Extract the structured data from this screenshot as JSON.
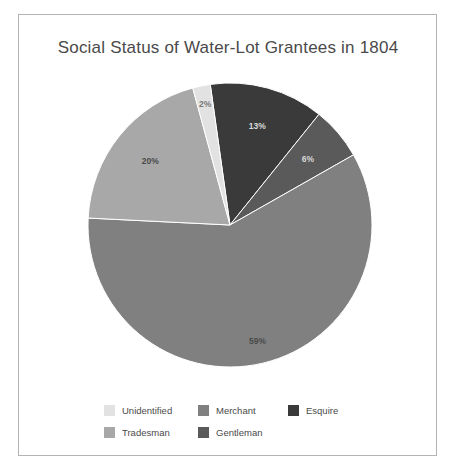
{
  "figure": {
    "title": "Social Status of Water-Lot Grantees in 1804",
    "background_color": "#ffffff",
    "frame_color": "#b4b4b4",
    "title_color": "#4a4a4a"
  },
  "chart_data": {
    "type": "pie",
    "title": "Social Status of Water-Lot Grantees in 1804",
    "xlabel": "",
    "ylabel": "",
    "categories": [
      "Esquire",
      "Gentleman",
      "Merchant",
      "Tradesman",
      "Unidentified"
    ],
    "values": [
      13,
      6,
      59,
      20,
      2
    ],
    "data_labels": [
      "13%",
      "6%",
      "59%",
      "20%",
      "2%"
    ],
    "units": "percent",
    "total": 100,
    "start_angle_deg": -8,
    "direction": "clockwise",
    "grid": false,
    "legend_position": "bottom",
    "colors": [
      "#3a3a3a",
      "#5a5a5a",
      "#808080",
      "#a8a8a8",
      "#e2e2e2"
    ],
    "slices": [
      {
        "label": "Esquire",
        "value": 13,
        "data_label": "13%",
        "color": "#3a3a3a",
        "label_color": "#d8d8d8"
      },
      {
        "label": "Gentleman",
        "value": 6,
        "data_label": "6%",
        "color": "#5a5a5a",
        "label_color": "#d8d8d8"
      },
      {
        "label": "Merchant",
        "value": 59,
        "data_label": "59%",
        "color": "#808080",
        "label_color": "#4a4a4a"
      },
      {
        "label": "Tradesman",
        "value": 20,
        "data_label": "20%",
        "color": "#a8a8a8",
        "label_color": "#4a4a4a"
      },
      {
        "label": "Unidentified",
        "value": 2,
        "data_label": "2%",
        "color": "#e2e2e2",
        "label_color": "#777777"
      }
    ]
  },
  "legend": {
    "columns": [
      {
        "entries": [
          {
            "label": "Unidentified",
            "color": "#e2e2e2"
          },
          {
            "label": "Tradesman",
            "color": "#a8a8a8"
          }
        ]
      },
      {
        "entries": [
          {
            "label": "Merchant",
            "color": "#808080"
          },
          {
            "label": "Gentleman",
            "color": "#5a5a5a"
          }
        ]
      },
      {
        "entries": [
          {
            "label": "Esquire",
            "color": "#3a3a3a"
          }
        ]
      }
    ]
  }
}
